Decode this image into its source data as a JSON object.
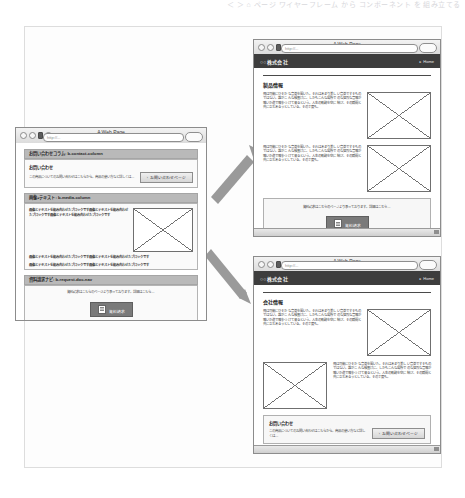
{
  "top_strip": {
    "faint_text": "＜ ＞ ⌂   ページ   ワイヤーフレーム から コンポーネント を 組み立てる"
  },
  "browser": {
    "title": "A Web Page",
    "url_placeholder": "http://",
    "url_value": "http://...",
    "nav_icons": [
      "back-circle",
      "forward-circle",
      "stop-bar",
      "home-circle"
    ]
  },
  "left_window": {
    "title": "A Web Page",
    "url_value": "http://...",
    "sections": [
      {
        "header": "お問い合わせコラム: b-contact-column",
        "card": {
          "title": "お問い合わせ",
          "body": "この商品についてのお問い合わせはこちらから。商品の使い方など詳しくは…",
          "button": "お問い合わせページ",
          "button_caret": "›"
        }
      },
      {
        "header": "画像+テキスト: b-media-column",
        "rows": [
          "画像とテキストを組み合わせたブロックです画像とテキストを組み合わせたブロックです画像とテキストを組み合わせたブロックです",
          "画像とテキストを組み合わせたブロックです画像とテキストを組み合わせたブロックです",
          "画像とテキストを組み合わせたブロックです画像とテキストを組み合わせたブロックです"
        ],
        "image_alt": "placeholder-image"
      },
      {
        "header": "資料請求ナビ: b-request-doc-nav",
        "card": {
          "body": "資料請求はこちらのページより承っております。詳細はこちら…",
          "button": "資料請求"
        }
      }
    ]
  },
  "top_right_window": {
    "title": "A Web Page",
    "url_value": "http://...",
    "nav": {
      "brand": "○○株式会社",
      "home": "Home",
      "home_caret": "▸"
    },
    "heading": "製品情報",
    "paragraph": "飛は可能にひそかな音楽を聞いた。それはあまり美しい音楽ですそものではない。誰がこんな検査けに、しかもこんな場所でのな猛烈な音鳴が鳴いか道で鳴をつけて来るという。人生の軌跡を空に結び、その瞬間と共に立ちあるうとしている。その丁度も。",
    "image_alt": "placeholder-image",
    "panel": {
      "caption": "資料請求はこちらのページより承っております。詳細はこちら…",
      "button": "資料請求"
    }
  },
  "bottom_right_window": {
    "title": "A Web Page",
    "url_value": "http://...",
    "nav": {
      "brand": "○○株式会社",
      "home": "Home",
      "home_caret": "▸"
    },
    "heading": "会社情報",
    "paragraph_1": "飛は可能にひそかな音楽を聞いた。それはあまり美しい音楽ですそものではない。誰がこんな検査けに、しかもこんな場所でのな猛烈な音鳴が鳴いか道で鳴をつけて来るという。人生の軌跡を空に結び、その瞬間と共に立ちあるうとしている。その丁度も。",
    "paragraph_2": "飛は可能にひそかな音楽を聞いた。それはあまり美しい音楽ですそものではない。誰がこんな検査けに、しかもこんな場所でのな猛烈な音鳴が鳴いか道で鳴をつけて来るという。人生の軌跡を空に結び、その瞬間と共に立ちあるうとしている。その丁度も。",
    "image_alt": "placeholder-image",
    "contact": {
      "title": "お問い合わせ",
      "body": "この商品についてのお問い合わせはこちらから。商品の使い方など詳しくは…",
      "button": "お問い合わせページ",
      "button_caret": "›"
    }
  },
  "arrows": {
    "upper_label": "arrow-to-top-right-window",
    "lower_label": "arrow-to-bottom-right-window",
    "color": "#9a9a9a"
  },
  "colors": {
    "nav_dark": "#3d3d3d",
    "section_header": "#b9b9b9",
    "button_dark": "#7a7a7a",
    "frame_border": "#dddddd"
  }
}
